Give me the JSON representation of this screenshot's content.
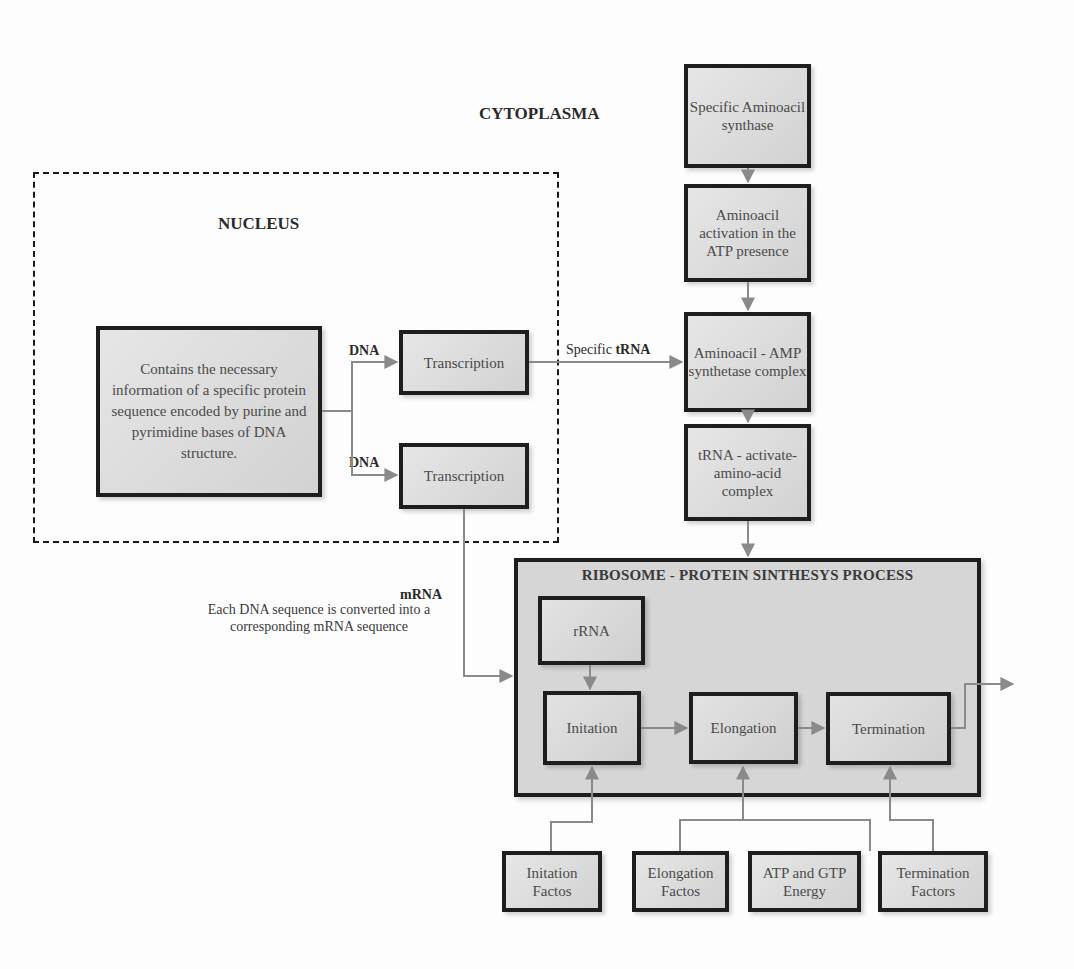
{
  "regions": {
    "cytoplasma": "CYTOPLASMA",
    "nucleus": "NUCLEUS"
  },
  "nucleus": {
    "info_box": "Contains the necessary information of a specific protein sequence encoded by purine and pyrimidine bases of DNA structure.",
    "dna_label_1": "DNA",
    "dna_label_2": "DNA",
    "transcription_1": "Transcription",
    "transcription_2": "Transcription"
  },
  "trna_path": {
    "label_prefix": "Specific ",
    "label_bold": "tRNA",
    "steps": [
      "Specific Aminoacil synthase",
      "Aminoacil activation in the ATP presence",
      "Aminoacil - AMP synthetase complex",
      "tRNA - activate-amino-acid complex"
    ]
  },
  "mrna": {
    "label": "mRNA",
    "caption": "Each DNA sequence is converted into a corresponding mRNA sequence"
  },
  "ribosome": {
    "title": "RIBOSOME  - PROTEIN SINTHESYS PROCESS",
    "rrna": "rRNA",
    "stages": [
      "Initation",
      "Elongation",
      "Termination"
    ]
  },
  "factors": [
    "Initation Factos",
    "Elongation Factos",
    "ATP and GTP Energy",
    "Termination Factors"
  ],
  "colors": {
    "box_border": "#1e1e1e",
    "box_fill": "#d6d6d6",
    "arrow": "#8a8a8a"
  }
}
